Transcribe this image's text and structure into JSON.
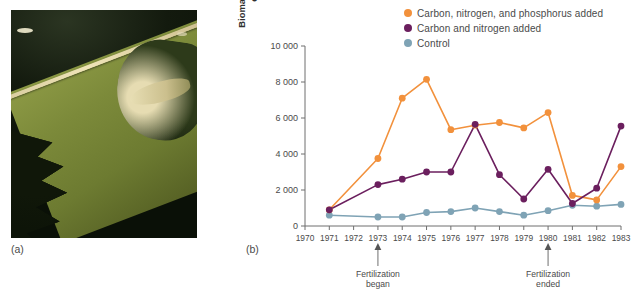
{
  "panels": {
    "a": {
      "label": "(a)",
      "alt": "aerial-photograph-of-lake-226-divided-by-curtain"
    },
    "b": {
      "label": "(b)"
    }
  },
  "photo": {
    "name": "lake-aerial-photo",
    "dark_water_color": "#121a0b",
    "green_water_color": "#7c8a3a",
    "curtain_color": "#e6dcb2",
    "shore_color": "#2d3a1a"
  },
  "chart_data": {
    "type": "line",
    "title": "",
    "xlabel": "",
    "ylabel": "Biomass of phytoplankton in the epilimnion (mg C/m³)",
    "ylabel_line1": "Biomass of phytoplankton in the",
    "ylabel_line2": "epilimnion (mg C/m³)",
    "x": [
      1970,
      1971,
      1972,
      1973,
      1974,
      1975,
      1976,
      1977,
      1978,
      1979,
      1980,
      1981,
      1982,
      1983
    ],
    "xtick_labels": [
      "1970",
      "1971",
      "1972",
      "1973",
      "1974",
      "1975",
      "1976",
      "1977",
      "1978",
      "1979",
      "1980",
      "1981",
      "1982",
      "1983"
    ],
    "ytick_labels": [
      "0",
      "2 000",
      "4 000",
      "6 000",
      "8 000",
      "10 000"
    ],
    "ytick_values": [
      0,
      2000,
      4000,
      6000,
      8000,
      10000
    ],
    "ylim": [
      0,
      10000
    ],
    "xlim": [
      1970,
      1983
    ],
    "grid": false,
    "legend_position": "top-right",
    "series": [
      {
        "name": "Carbon, nitrogen, and phosphorus added",
        "color": "#F2913C",
        "x": [
          1971,
          1973,
          1974,
          1975,
          1976,
          1977,
          1978,
          1979,
          1980,
          1981,
          1982,
          1983
        ],
        "values": [
          900,
          3750,
          7100,
          8150,
          5350,
          5600,
          5750,
          5450,
          6300,
          1700,
          1450,
          3300
        ]
      },
      {
        "name": "Carbon and nitrogen added",
        "color": "#6B1F5E",
        "x": [
          1971,
          1973,
          1974,
          1975,
          1976,
          1977,
          1978,
          1979,
          1980,
          1981,
          1982,
          1983
        ],
        "values": [
          900,
          2300,
          2600,
          3000,
          3000,
          5650,
          2850,
          1500,
          3150,
          1250,
          2100,
          5550
        ]
      },
      {
        "name": "Control",
        "color": "#7FA3B5",
        "x": [
          1971,
          1973,
          1974,
          1975,
          1976,
          1977,
          1978,
          1979,
          1980,
          1981,
          1982,
          1983
        ],
        "values": [
          600,
          500,
          500,
          750,
          800,
          1000,
          800,
          600,
          850,
          1150,
          1100,
          1200
        ]
      }
    ],
    "annotations": [
      {
        "x": 1973,
        "text_line1": "Fertilization",
        "text_line2": "began",
        "arrow": "up"
      },
      {
        "x": 1980,
        "text_line1": "Fertilization",
        "text_line2": "ended",
        "arrow": "up"
      }
    ]
  }
}
